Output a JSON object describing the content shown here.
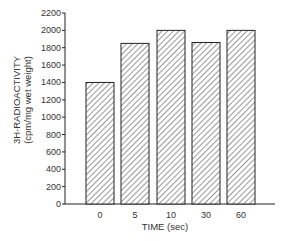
{
  "chart_data": {
    "type": "bar",
    "title": "",
    "xlabel": "TIME (sec)",
    "ylabel": "3H-RADIOACTIVITY",
    "ylabel_units": "(cpm/mg wet weight)",
    "categories": [
      "0",
      "5",
      "10",
      "30",
      "60"
    ],
    "values": [
      1400,
      1850,
      2000,
      1860,
      2000
    ],
    "ylim": [
      0,
      2200
    ],
    "yticks": [
      0,
      200,
      400,
      600,
      800,
      1000,
      1200,
      1400,
      1600,
      1800,
      2000,
      2200
    ],
    "grid": false,
    "legend": null,
    "bar_pattern": "diagonal-hatch",
    "colors": {
      "bar_fill": "#ffffff",
      "bar_stroke": "#222222",
      "hatch": "#444444",
      "axis": "#222222"
    }
  }
}
